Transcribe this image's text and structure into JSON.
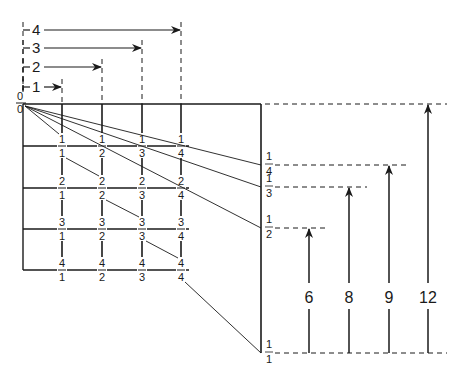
{
  "diagram": {
    "title_hidden": "",
    "top_brackets": [
      {
        "label": "1",
        "x_end": 62,
        "y": 87
      },
      {
        "label": "2",
        "x_end": 102,
        "y": 67
      },
      {
        "label": "3",
        "x_end": 142,
        "y": 48
      },
      {
        "label": "4",
        "x_end": 181,
        "y": 30
      }
    ],
    "origin_labels": {
      "top": "0",
      "bottom": "0"
    },
    "grid": {
      "left": 23,
      "top": 104,
      "col_x": [
        62,
        102,
        142,
        181
      ],
      "row_y": [
        146,
        188,
        229,
        270
      ],
      "cells": [
        [
          {
            "n": "1",
            "d": "1"
          },
          {
            "n": "1",
            "d": "2"
          },
          {
            "n": "1",
            "d": "3"
          },
          {
            "n": "1",
            "d": "4"
          }
        ],
        [
          {
            "n": "2",
            "d": "1"
          },
          {
            "n": "2",
            "d": "2"
          },
          {
            "n": "2",
            "d": "3"
          },
          {
            "n": "2",
            "d": "4"
          }
        ],
        [
          {
            "n": "3",
            "d": "1"
          },
          {
            "n": "3",
            "d": "2"
          },
          {
            "n": "3",
            "d": "3"
          },
          {
            "n": "3",
            "d": "4"
          }
        ],
        [
          {
            "n": "4",
            "d": "1"
          },
          {
            "n": "4",
            "d": "2"
          },
          {
            "n": "4",
            "d": "3"
          },
          {
            "n": "4",
            "d": "4"
          }
        ]
      ]
    },
    "scale": {
      "x": 261,
      "top": 104,
      "bottom": 353,
      "marks": [
        {
          "label_n": "1",
          "label_d": "4",
          "y": 165
        },
        {
          "label_n": "1",
          "label_d": "3",
          "y": 187
        },
        {
          "label_n": "1",
          "label_d": "2",
          "y": 228
        },
        {
          "label_n": "1",
          "label_d": "1",
          "y": 353
        }
      ]
    },
    "arrows": [
      {
        "label": "6",
        "x": 309,
        "top": 228
      },
      {
        "label": "8",
        "x": 349,
        "top": 187
      },
      {
        "label": "9",
        "x": 389,
        "top": 165
      },
      {
        "label": "12",
        "x": 428,
        "top": 104
      }
    ],
    "colors": {
      "ink": "#1a1a1a",
      "background": "#ffffff"
    }
  }
}
